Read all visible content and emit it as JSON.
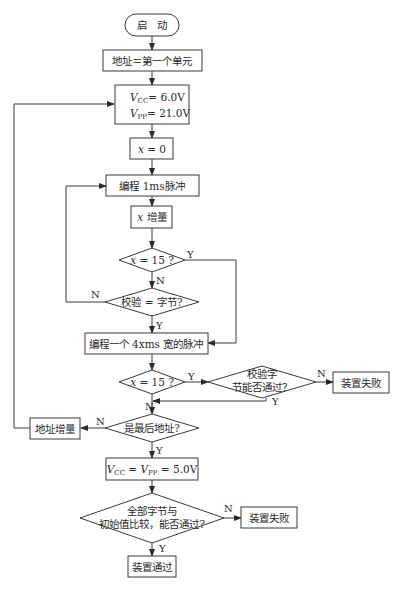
{
  "diagram": {
    "type": "flowchart",
    "nodes": {
      "start": "启　动",
      "addr_first": "地址＝第一个单元",
      "vcc_set": {
        "v": "V",
        "cc": "CC",
        "vcc_val": "= 6.0V",
        "pp": "PP",
        "vpp_val": "= 21.0V"
      },
      "x_zero": {
        "var": "x",
        "rest": " = 0"
      },
      "prog_1ms": "编程 1ms脉冲",
      "x_inc": {
        "var": "x",
        "rest": " 增量"
      },
      "x_eq15_a": {
        "var": "x",
        "rest": " = 15 ?"
      },
      "verify_byte": "校验 = 字节?",
      "prog_4xms": "编程一个 4xms 宽的脉冲",
      "x_eq15_b": {
        "var": "x",
        "rest": " = 15 ?"
      },
      "verify_pass_l1": "校验字",
      "verify_pass_l2": "节能否通过？",
      "fail_1": "装置失败",
      "last_addr": "是最后地址?",
      "addr_inc": "地址增量",
      "vcc_vpp_5": {
        "v": "V",
        "cc": "CC",
        "eq": " = ",
        "pp": "PP",
        "val": " = 5.0V"
      },
      "compare_l1": "全部字节与",
      "compare_l2": "初始值比较，能否通过?",
      "fail_2": "装置失败",
      "pass": "装置通过"
    },
    "edge_labels": {
      "x15a_yes": "Y",
      "x15a_no": "N",
      "verify_no": "N",
      "verify_yes": "Y",
      "x15b_yes": "Y",
      "x15b_no": "N",
      "verifypass_no": "N",
      "verifypass_yes": "Y",
      "last_no": "N",
      "last_yes": "Y",
      "compare_no": "N",
      "compare_yes": "Y"
    }
  }
}
